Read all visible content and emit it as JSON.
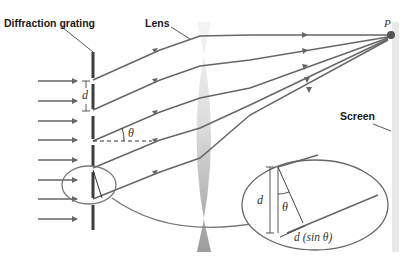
{
  "labels": {
    "grating": "Diffraction grating",
    "lens": "Lens",
    "screen": "Screen",
    "point": "P",
    "slit_spacing": "d",
    "angle": "θ",
    "inset_d": "d",
    "inset_theta": "θ",
    "path_difference": "d (sin θ)"
  },
  "colors": {
    "ray": "#666666",
    "grating": "#444444",
    "lens_light": "#f2f2f2",
    "lens_dark": "#9a9a9a",
    "screen": "#e6e6e6",
    "point": "#555555"
  }
}
